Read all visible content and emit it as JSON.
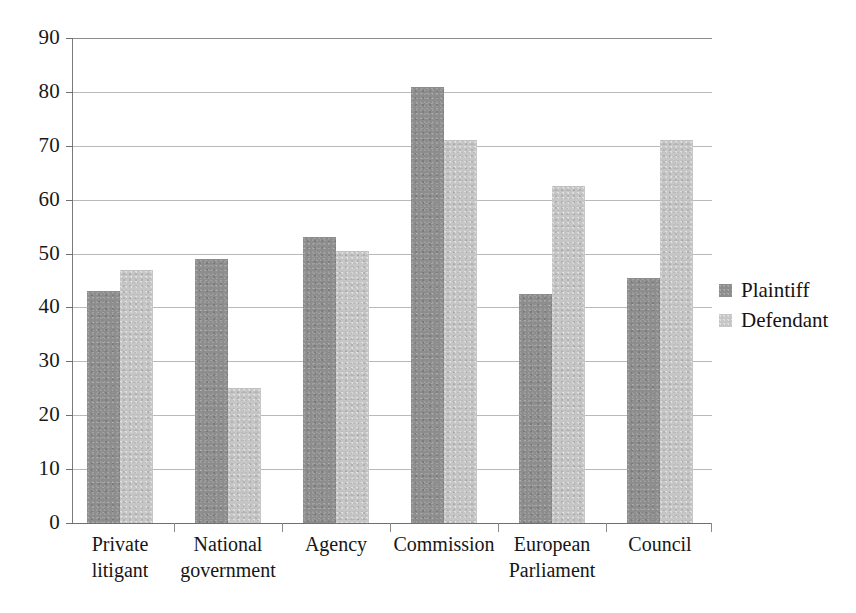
{
  "chart_data": {
    "type": "bar",
    "title": "",
    "subtitle": "",
    "xlabel": "",
    "ylabel": "",
    "ylim": [
      0,
      90
    ],
    "ytick_step": 10,
    "yticks": [
      90,
      80,
      70,
      60,
      50,
      40,
      30,
      20,
      10,
      0
    ],
    "grid": true,
    "grid_axis": "y",
    "legend_position": "right",
    "categories": [
      "Private litigant",
      "National government",
      "Agency",
      "Commission",
      "European Parliament",
      "Council"
    ],
    "category_lines": [
      [
        "Private",
        "litigant"
      ],
      [
        "National",
        "government"
      ],
      [
        "Agency",
        ""
      ],
      [
        "Commission",
        ""
      ],
      [
        "European",
        "Parliament"
      ],
      [
        "Council",
        ""
      ]
    ],
    "series": [
      {
        "name": "Plaintiff",
        "color": "#8d8d8d",
        "values": [
          43,
          49,
          53,
          81,
          42.5,
          45.5
        ]
      },
      {
        "name": "Defendant",
        "color": "#c6c6c6",
        "values": [
          47,
          25,
          50.5,
          71,
          62.5,
          71
        ]
      }
    ]
  },
  "legend": {
    "items": [
      {
        "label": "Plaintiff",
        "swatch": "plaintiff"
      },
      {
        "label": "Defendant",
        "swatch": "defendant"
      }
    ]
  },
  "colors": {
    "plaintiff": "#8d8d8d",
    "defendant": "#c6c6c6",
    "gridline": "#b9b9b9",
    "axis": "#7a7a7a",
    "text": "#161616",
    "background": "#ffffff"
  }
}
